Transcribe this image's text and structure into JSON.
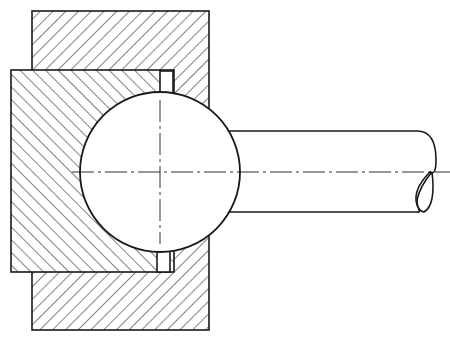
{
  "figure": {
    "components": [
      {
        "id": "outer-housing",
        "label": "Outer housing (hatched)",
        "hatch": "forward"
      },
      {
        "id": "inner-socket",
        "label": "Inner socket block (hatched)",
        "hatch": "backward"
      },
      {
        "id": "ball",
        "label": "Ball"
      },
      {
        "id": "shaft",
        "label": "Shaft with break symbol"
      },
      {
        "id": "centerlines",
        "label": "Center lines (dash-dot)"
      }
    ],
    "colors": {
      "line": "#1a1a1a",
      "background": "#ffffff"
    }
  }
}
